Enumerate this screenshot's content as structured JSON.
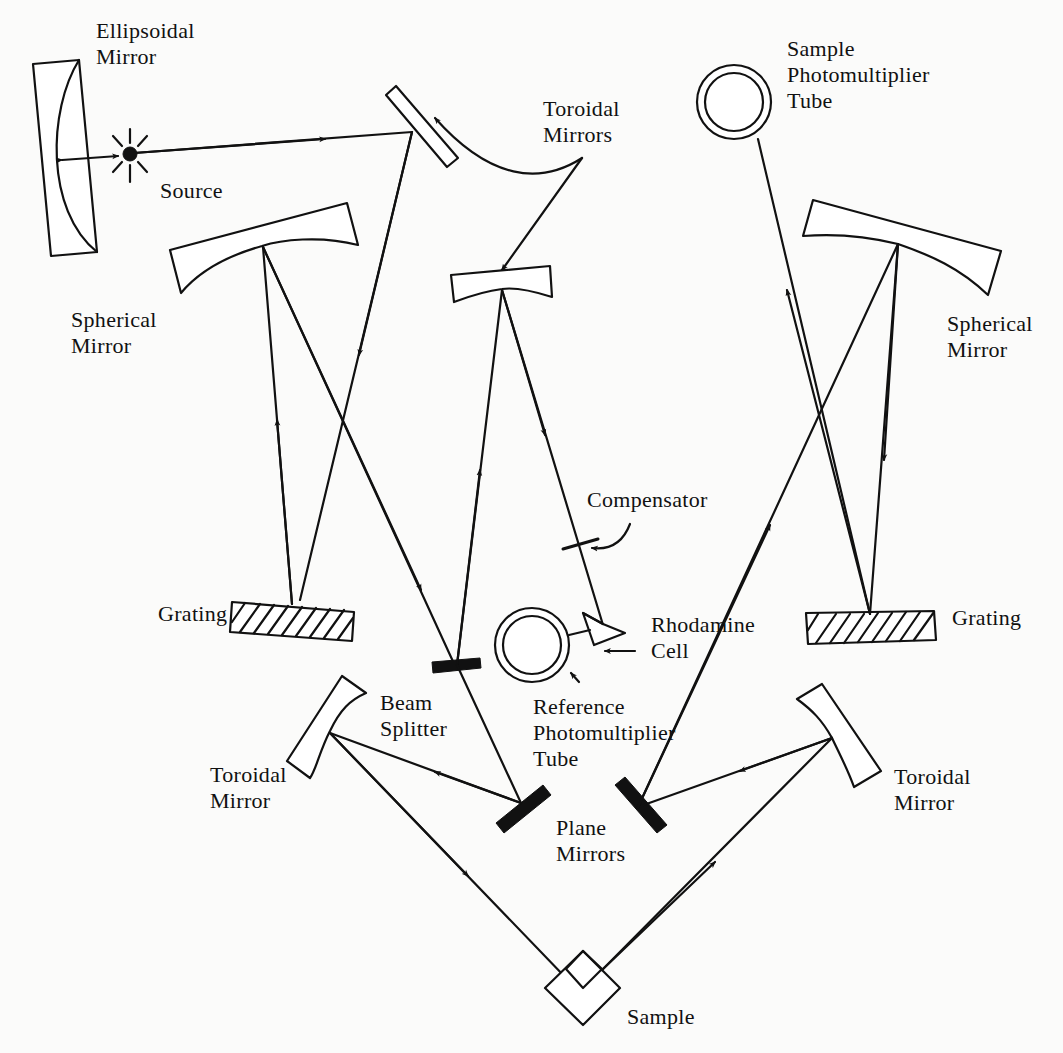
{
  "figure": {
    "type": "optical schematic — double-beam spectrometer",
    "components": [
      {
        "id": "ellipsoidal_mirror",
        "label": "Ellipsoidal\nMirror"
      },
      {
        "id": "source",
        "label": "Source"
      },
      {
        "id": "toroidal_mirrors",
        "label": "Toroidal\nMirrors"
      },
      {
        "id": "sample_pmt",
        "label": "Sample\nPhotomultiplier\nTube"
      },
      {
        "id": "spherical_mirror_left",
        "label": "Spherical\nMirror"
      },
      {
        "id": "spherical_mirror_right",
        "label": "Spherical\nMirror"
      },
      {
        "id": "compensator",
        "label": "Compensator"
      },
      {
        "id": "grating_left",
        "label": "Grating"
      },
      {
        "id": "grating_right",
        "label": "Grating"
      },
      {
        "id": "rhodamine_cell",
        "label": "Rhodamine\nCell"
      },
      {
        "id": "reference_pmt",
        "label": "Reference\nPhotomultiplier\nTube"
      },
      {
        "id": "beam_splitter",
        "label": "Beam\nSplitter"
      },
      {
        "id": "toroidal_mirror_left",
        "label": "Toroidal\nMirror"
      },
      {
        "id": "toroidal_mirror_right",
        "label": "Toroidal\nMirror"
      },
      {
        "id": "plane_mirrors",
        "label": "Plane\nMirrors"
      },
      {
        "id": "sample",
        "label": "Sample"
      }
    ]
  },
  "labels": {
    "ellipsoidal_mirror": "Ellipsoidal\nMirror",
    "source": "Source",
    "toroidal_mirrors": "Toroidal\nMirrors",
    "sample_pmt": "Sample\nPhotomultiplier\nTube",
    "spherical_mirror_left": "Spherical\nMirror",
    "spherical_mirror_right": "Spherical\nMirror",
    "compensator": "Compensator",
    "grating_left": "Grating",
    "grating_right": "Grating",
    "rhodamine_cell": "Rhodamine\nCell",
    "reference_pmt": "Reference\nPhotomultiplier\nTube",
    "beam_splitter": "Beam\nSplitter",
    "toroidal_mirror_left": "Toroidal\nMirror",
    "toroidal_mirror_right": "Toroidal\nMirror",
    "plane_mirrors": "Plane\nMirrors",
    "sample": "Sample"
  },
  "colors": {
    "ink": "#111111",
    "paper": "#fbfbfa"
  }
}
